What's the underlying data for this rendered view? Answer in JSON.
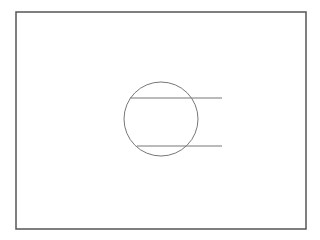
{
  "canvas": {
    "width": 320,
    "height": 240,
    "background": "#ffffff"
  },
  "frame": {
    "x": 16,
    "y": 12,
    "width": 290,
    "height": 217,
    "stroke": "#555555",
    "stroke_width": 1.5
  },
  "circle": {
    "cx": 161,
    "cy": 119,
    "r": 37,
    "stroke": "#777777",
    "stroke_width": 1
  },
  "lines": [
    {
      "x1": 130,
      "y1": 98,
      "x2": 222,
      "y2": 98,
      "stroke": "#777777",
      "stroke_width": 1
    },
    {
      "x1": 137,
      "y1": 146,
      "x2": 222,
      "y2": 146,
      "stroke": "#777777",
      "stroke_width": 1
    }
  ]
}
